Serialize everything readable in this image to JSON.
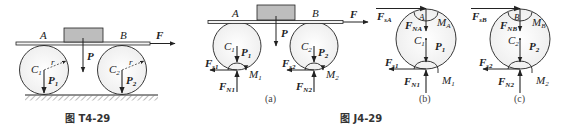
{
  "figure_left": {
    "caption": "图 T4-29",
    "labels": {
      "A": "A",
      "B": "B",
      "F": "F",
      "P": "P",
      "C1": "C",
      "C1_sub": "1",
      "C2": "C",
      "C2_sub": "2",
      "r1": "r",
      "r2": "r",
      "P1": "P",
      "P1_sub": "1",
      "P2": "P",
      "P2_sub": "2"
    }
  },
  "figure_right": {
    "caption": "图 J4-29",
    "panels": {
      "a": {
        "label": "(a)",
        "A": "A",
        "B": "B",
        "F": "F",
        "P": "P",
        "C1": "C",
        "C1_sub": "1",
        "C2": "C",
        "C2_sub": "2",
        "P1": "P",
        "P1_sub": "1",
        "P2": "P",
        "P2_sub": "2",
        "Fs1": "F",
        "Fs1_sub": "s1",
        "Fs2": "F",
        "Fs2_sub": "s2",
        "FN1": "F",
        "FN1_sub": "N1",
        "FN2": "F",
        "FN2_sub": "N2",
        "M1": "M",
        "M1_sub": "1",
        "M2": "M",
        "M2_sub": "2"
      },
      "b": {
        "label": "(b)",
        "FsA": "F",
        "FsA_sub": "sA",
        "A": "A",
        "FNA": "F",
        "FNA_sub": "NA",
        "MA": "M",
        "MA_sub": "A",
        "C1": "C",
        "C1_sub": "1",
        "P1": "P",
        "P1_sub": "1",
        "Fs1": "F",
        "Fs1_sub": "s1",
        "FN1": "F",
        "FN1_sub": "N1",
        "M1": "M",
        "M1_sub": "1"
      },
      "c": {
        "label": "(c)",
        "FsB": "F",
        "FsB_sub": "sB",
        "B": "B",
        "FNB": "F",
        "FNB_sub": "NB",
        "MB": "M",
        "MB_sub": "B",
        "C2": "C",
        "C2_sub": "2",
        "P2": "P",
        "P2_sub": "2",
        "Fs2": "F",
        "Fs2_sub": "s2",
        "FN2": "F",
        "FN2_sub": "N2",
        "M2": "M",
        "M2_sub": "2"
      }
    }
  },
  "colors": {
    "line": "#222222",
    "block_fill": "#bdbdbd",
    "wheel_fill": "#f4f4f4",
    "plank_fill": "#f2f2f2"
  }
}
